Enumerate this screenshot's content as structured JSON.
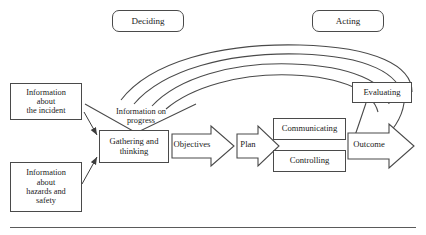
{
  "figure": {
    "phases": [
      {
        "id": "deciding",
        "label": "Deciding"
      },
      {
        "id": "acting",
        "label": "Acting"
      }
    ],
    "inputs": [
      {
        "id": "incident-information",
        "label": "Information\nabout\nthe incident"
      },
      {
        "id": "hazards-information",
        "label": "Information\nabout\nhazards and\nsafety"
      }
    ],
    "nodes": [
      {
        "id": "gathering-and-thinking",
        "label": "Gathering and\nthinking"
      },
      {
        "id": "communicating",
        "label": "Communicating"
      },
      {
        "id": "controlling",
        "label": "Controlling"
      },
      {
        "id": "evaluating",
        "label": "Evaluating"
      }
    ],
    "block_arrows": [
      {
        "id": "objectives",
        "label": "Objectives"
      },
      {
        "id": "plan",
        "label": "Plan"
      },
      {
        "id": "outcome",
        "label": "Outcome"
      }
    ],
    "feedback": {
      "id": "information-on-progress",
      "label": "Information on\nprogress"
    },
    "colors": {
      "stroke": "#4a4a4a",
      "thin_stroke": "#3c3c3c",
      "fill": "#ffffff",
      "text": "#1a1a1a",
      "rule": "#5a5a5a"
    }
  }
}
